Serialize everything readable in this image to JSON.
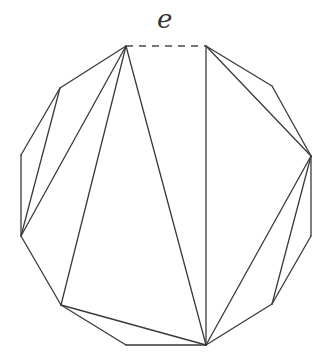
{
  "diagram": {
    "edge_label": "e",
    "vertices": [
      {
        "id": "V0",
        "x": 126,
        "y": 46
      },
      {
        "id": "V1",
        "x": 206,
        "y": 46
      },
      {
        "id": "V2",
        "x": 272,
        "y": 86
      },
      {
        "id": "V3",
        "x": 311,
        "y": 156
      },
      {
        "id": "V4",
        "x": 311,
        "y": 236
      },
      {
        "id": "V5",
        "x": 272,
        "y": 304
      },
      {
        "id": "V6",
        "x": 206,
        "y": 345
      },
      {
        "id": "V7",
        "x": 126,
        "y": 345
      },
      {
        "id": "V8",
        "x": 61,
        "y": 305
      },
      {
        "id": "V9",
        "x": 21,
        "y": 236
      },
      {
        "id": "V10",
        "x": 21,
        "y": 155
      },
      {
        "id": "V11",
        "x": 60,
        "y": 88
      }
    ],
    "dashed_edge": [
      "V0",
      "V1"
    ],
    "polygon_edges": [
      [
        "V1",
        "V2"
      ],
      [
        "V2",
        "V3"
      ],
      [
        "V3",
        "V4"
      ],
      [
        "V4",
        "V5"
      ],
      [
        "V5",
        "V6"
      ],
      [
        "V6",
        "V7"
      ],
      [
        "V7",
        "V8"
      ],
      [
        "V8",
        "V9"
      ],
      [
        "V9",
        "V10"
      ],
      [
        "V10",
        "V11"
      ],
      [
        "V11",
        "V0"
      ]
    ],
    "diagonals": [
      [
        "V1",
        "V6"
      ],
      [
        "V1",
        "V3"
      ],
      [
        "V3",
        "V6"
      ],
      [
        "V3",
        "V5"
      ],
      [
        "V0",
        "V6"
      ],
      [
        "V0",
        "V8"
      ],
      [
        "V0",
        "V9"
      ],
      [
        "V11",
        "V9"
      ],
      [
        "V8",
        "V6"
      ]
    ],
    "colors": {
      "stroke": "#3a3a3a",
      "background": "#ffffff"
    }
  }
}
